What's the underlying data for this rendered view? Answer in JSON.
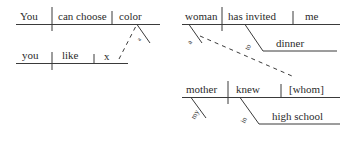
{
  "figure": {
    "type": "reed-kellogg-sentence-diagrams",
    "background_color": "#ffffff",
    "line_color": "#3a3a3a",
    "text_color": "#2b2b2b"
  },
  "diagram_left": {
    "name": "You can choose color you like",
    "main_clause": {
      "subject": "You",
      "verb": "can choose",
      "object": "color"
    },
    "modifier_on_object": "a",
    "subordinate_clause": {
      "subject": "you",
      "verb": "like",
      "object": "x"
    },
    "connector": "dashed-relative-link"
  },
  "diagram_right": {
    "name": "A woman has invited me to dinner whom my mother knew in high school",
    "main_clause": {
      "subject": "woman",
      "verb": "has invited",
      "object": "me"
    },
    "modifier_on_subject": "a",
    "prepositional_phrase": {
      "preposition": "to",
      "object": "dinner"
    },
    "subordinate_clause": {
      "subject": "mother",
      "verb": "knew",
      "object": "[whom]"
    },
    "modifier_on_sub_subject": "my",
    "sub_prepositional_phrase": {
      "preposition": "in",
      "object": "high school"
    },
    "connector": "dashed-relative-link"
  }
}
